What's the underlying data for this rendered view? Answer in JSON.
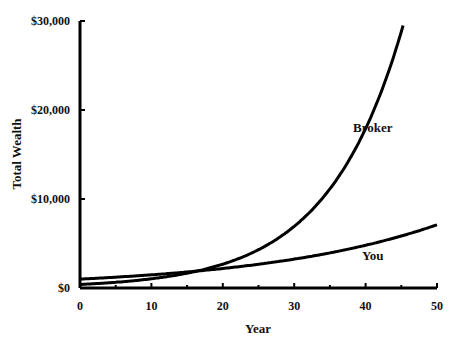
{
  "chart_data": {
    "type": "line",
    "title": "",
    "xlabel": "Year",
    "ylabel": "Total Wealth",
    "xlim": [
      0,
      50
    ],
    "ylim": [
      0,
      30000
    ],
    "x_ticks": [
      0,
      10,
      20,
      30,
      40,
      50
    ],
    "x_minor_ticks": [
      5,
      15,
      25,
      35,
      45
    ],
    "y_ticks": [
      0,
      10000,
      20000,
      30000
    ],
    "y_tick_labels": [
      "$0",
      "$10,000",
      "$20,000",
      "$30,000"
    ],
    "x_tick_labels": [
      "0",
      "10",
      "20",
      "30",
      "40",
      "50"
    ],
    "grid": false,
    "legend": "inline labels",
    "x": [
      0,
      5,
      10,
      15,
      17,
      20,
      25,
      30,
      35,
      40,
      45,
      46,
      50
    ],
    "series": [
      {
        "name": "Broker",
        "label_position": {
          "year": 41,
          "value": 17500
        },
        "values": [
          400,
          642,
          1031,
          1656,
          2000,
          2660,
          4272,
          6861,
          11020,
          17700,
          28430,
          30000,
          null
        ]
      },
      {
        "name": "You",
        "label_position": {
          "year": 41,
          "value": 3100
        },
        "values": [
          1000,
          1217,
          1480,
          1801,
          1948,
          2191,
          2666,
          3243,
          3946,
          4801,
          5841,
          6075,
          7107
        ]
      }
    ]
  }
}
